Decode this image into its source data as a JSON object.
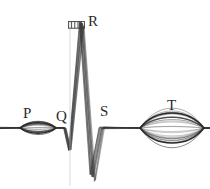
{
  "figure": {
    "background_color": "#ffffff",
    "ink_color": "#2b2b2b",
    "width": 210,
    "height": 189
  },
  "labels": {
    "p": "P",
    "q": "Q",
    "r": "R",
    "s": "S",
    "t": "T"
  },
  "scale_marker": {
    "name": "time-scale-marker",
    "ticks": 5,
    "description": "small ruled scale bar above R peak"
  },
  "chart_data": {
    "type": "line",
    "xlabel": "",
    "ylabel": "",
    "grid": false,
    "legend": "none",
    "xlim": [
      0,
      210
    ],
    "ylim": [
      189,
      0
    ],
    "baseline_y": 128,
    "annotations": [
      {
        "text": "P",
        "x": 29,
        "y": 113,
        "wave": "P-wave"
      },
      {
        "text": "Q",
        "x": 61,
        "y": 116,
        "wave": "Q-deflection"
      },
      {
        "text": "R",
        "x": 93,
        "y": 21,
        "wave": "R-peak"
      },
      {
        "text": "S",
        "x": 105,
        "y": 111,
        "wave": "S-deflection"
      },
      {
        "text": "T",
        "x": 172,
        "y": 105,
        "wave": "T-wave"
      }
    ],
    "features": [
      {
        "name": "P-wave",
        "center_x": 38,
        "peak_y": 122,
        "trough_y": 134,
        "half_width": 18,
        "amplitude": 7,
        "shape": "spindle-bundle"
      },
      {
        "name": "Q-deflection",
        "center_x": 70,
        "peak_y": 135,
        "trough_y": 150,
        "half_width": 7,
        "amplitude": -12,
        "shape": "narrow-dip"
      },
      {
        "name": "R-peak",
        "center_x": 82,
        "peak_y": 24,
        "trough_y": 128,
        "half_width": 10,
        "amplitude": 104,
        "shape": "tall-narrow-spike"
      },
      {
        "name": "S-deflection",
        "center_x": 93,
        "peak_y": 128,
        "trough_y": 178,
        "half_width": 9,
        "amplitude": -50,
        "shape": "deep-narrow-trough"
      },
      {
        "name": "T-wave",
        "center_x": 172,
        "peak_y": 108,
        "trough_y": 148,
        "half_width": 32,
        "amplitude": 20,
        "shape": "spindle-bundle"
      }
    ],
    "reference_line": {
      "x": 70,
      "y_top": 22,
      "y_bottom": 186,
      "style": "faint-vertical"
    },
    "traces_count": 11,
    "x": [
      0,
      10,
      20,
      24,
      30,
      38,
      46,
      52,
      58,
      62,
      66,
      70,
      74,
      78,
      82,
      86,
      90,
      93,
      97,
      101,
      106,
      112,
      120,
      132,
      145,
      155,
      165,
      172,
      180,
      190,
      198,
      205,
      210
    ],
    "series": [
      {
        "name": "tracing-1",
        "values": [
          128,
          128,
          127,
          125,
          122,
          121,
          124,
          127,
          128,
          129,
          133,
          140,
          132,
          90,
          26,
          88,
          128,
          160,
          172,
          150,
          131,
          128,
          128,
          128,
          127,
          122,
          114,
          110,
          116,
          124,
          128,
          128,
          128
        ]
      },
      {
        "name": "tracing-2",
        "values": [
          129,
          128,
          128,
          126,
          123,
          122,
          125,
          128,
          129,
          130,
          134,
          142,
          134,
          96,
          30,
          94,
          130,
          163,
          176,
          152,
          132,
          129,
          128,
          128,
          128,
          124,
          117,
          112,
          118,
          125,
          129,
          128,
          128
        ]
      },
      {
        "name": "tracing-3",
        "values": [
          128,
          127,
          126,
          124,
          121,
          120,
          123,
          126,
          128,
          129,
          132,
          138,
          130,
          84,
          24,
          84,
          127,
          157,
          168,
          147,
          130,
          128,
          128,
          128,
          126,
          120,
          111,
          108,
          114,
          123,
          128,
          128,
          128
        ]
      }
    ]
  }
}
